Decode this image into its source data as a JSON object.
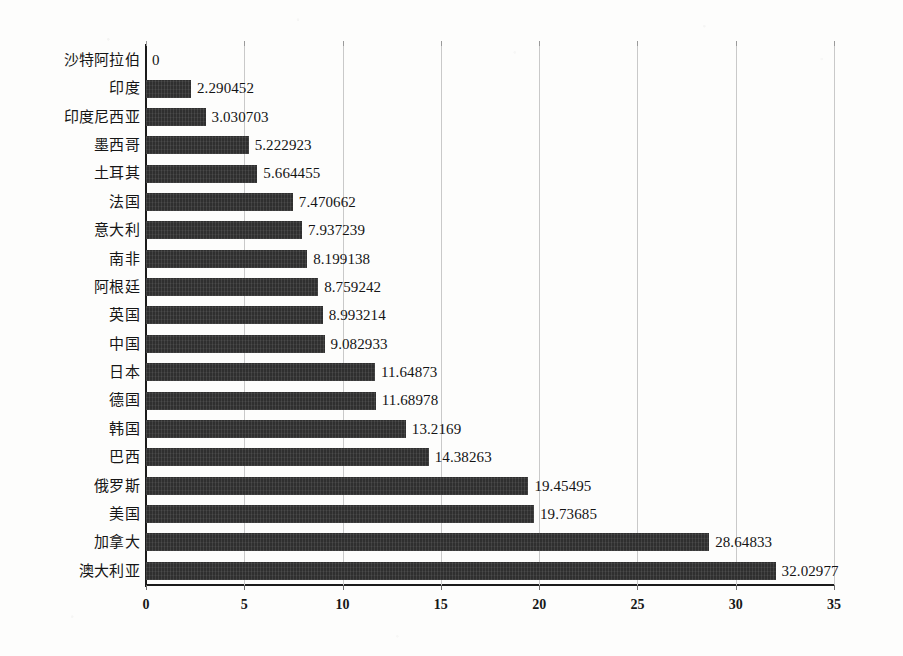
{
  "chart_data": {
    "type": "bar",
    "orientation": "horizontal",
    "title": "",
    "xlabel": "",
    "ylabel": "",
    "xlim": [
      0,
      35
    ],
    "xticks": [
      0,
      5,
      10,
      15,
      20,
      25,
      30,
      35
    ],
    "grid": true,
    "legend": false,
    "value_labels_shown": true,
    "bar_color": "#2f2f2f",
    "gridline_color": "#c9c9c9",
    "axis_color": "#1b1b1b",
    "background_color": "#fdfdfc",
    "categories": [
      "沙特阿拉伯",
      "印度",
      "印度尼西亚",
      "墨西哥",
      "土耳其",
      "法国",
      "意大利",
      "南非",
      "阿根廷",
      "英国",
      "中国",
      "日本",
      "德国",
      "韩国",
      "巴西",
      "俄罗斯",
      "美国",
      "加拿大",
      "澳大利亚"
    ],
    "values": [
      0,
      2.290452,
      3.030703,
      5.222923,
      5.664455,
      7.470662,
      7.937239,
      8.199138,
      8.759242,
      8.993214,
      9.082933,
      11.64873,
      11.68978,
      13.2169,
      14.38263,
      19.45495,
      19.73685,
      28.64833,
      32.02977
    ],
    "value_labels": [
      "0",
      "2.290452",
      "3.030703",
      "5.222923",
      "5.664455",
      "7.470662",
      "7.937239",
      "8.199138",
      "8.759242",
      "8.993214",
      "9.082933",
      "11.64873",
      "11.68978",
      "13.2169",
      "14.38263",
      "19.45495",
      "19.73685",
      "28.64833",
      "32.02977"
    ],
    "xtick_labels": [
      "0",
      "5",
      "10",
      "15",
      "20",
      "25",
      "30",
      "35"
    ]
  }
}
